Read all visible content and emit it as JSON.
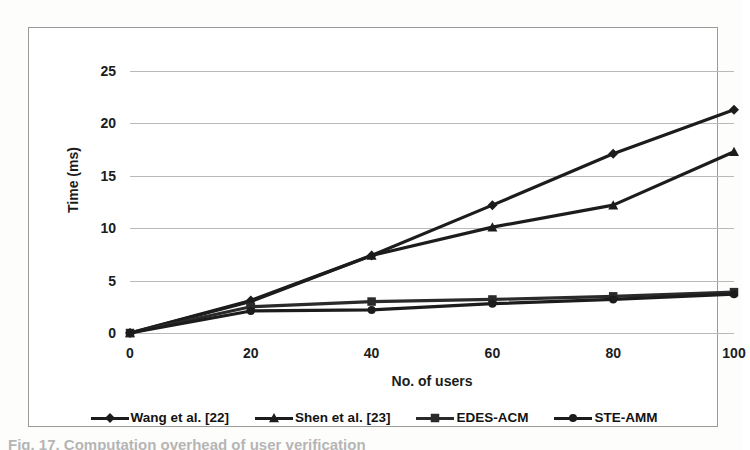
{
  "figure": {
    "caption_partial": "Fig. 17.  Computation overhead of user verification"
  },
  "chart_data": {
    "type": "line",
    "title": "",
    "xlabel": "No. of users",
    "ylabel": "Time (ms)",
    "xlim": [
      0,
      100
    ],
    "ylim": [
      0,
      25
    ],
    "grid": true,
    "legend_position": "bottom",
    "x": [
      0,
      20,
      40,
      60,
      80,
      100
    ],
    "xticks": [
      "0",
      "20",
      "40",
      "60",
      "80",
      "100"
    ],
    "yticks": [
      "0",
      "5",
      "10",
      "15",
      "20",
      "25"
    ],
    "series": [
      {
        "name": "Wang et al. [22]",
        "marker": "diamond",
        "color": "#1c1c1c",
        "values": [
          0,
          3.1,
          7.4,
          12.2,
          17.1,
          21.3
        ]
      },
      {
        "name": "Shen et al. [23]",
        "marker": "triangle",
        "color": "#1c1c1c",
        "values": [
          0,
          3.0,
          7.4,
          10.1,
          12.2,
          17.3
        ]
      },
      {
        "name": "EDES-ACM",
        "marker": "square",
        "color": "#2a2a2a",
        "values": [
          0,
          2.5,
          3.0,
          3.2,
          3.5,
          3.9
        ]
      },
      {
        "name": "STE-AMM",
        "marker": "circle",
        "color": "#1c1c1c",
        "values": [
          0,
          2.1,
          2.2,
          2.8,
          3.2,
          3.7
        ]
      }
    ]
  }
}
